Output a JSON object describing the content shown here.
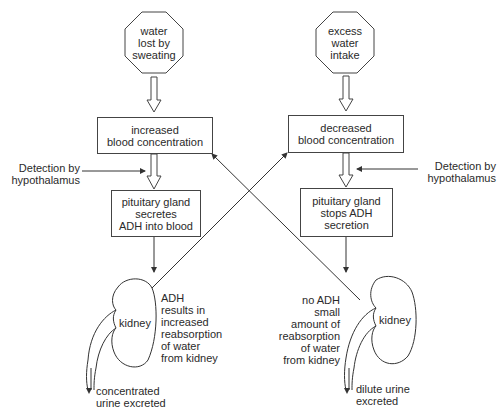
{
  "diagram": {
    "left": {
      "stimulus": [
        "water",
        "lost by",
        "sweating"
      ],
      "state": [
        "increased",
        "blood concentration"
      ],
      "detection": [
        "Detection by",
        "hypothalamus"
      ],
      "response": [
        "pituitary gland",
        "secretes",
        "ADH into blood"
      ],
      "organ": "kidney",
      "effect": [
        "ADH",
        "results in",
        "increased",
        "reabsorption",
        "of water",
        "from kidney"
      ],
      "output": [
        "concentrated",
        "urine excreted"
      ]
    },
    "right": {
      "stimulus": [
        "excess",
        "water",
        "intake"
      ],
      "state": [
        "decreased",
        "blood concentration"
      ],
      "detection": [
        "Detection by",
        "hypothalamus"
      ],
      "response": [
        "pituitary gland",
        "stops ADH",
        "secretion"
      ],
      "organ": "kidney",
      "effect": [
        "no ADH",
        "small",
        "amount of",
        "reabsorption",
        "of water",
        "from kidney"
      ],
      "output": [
        "dilute urine",
        "excreted"
      ]
    },
    "colors": {
      "line": "#333333",
      "text": "#2a2a2a",
      "background": "#ffffff"
    }
  }
}
